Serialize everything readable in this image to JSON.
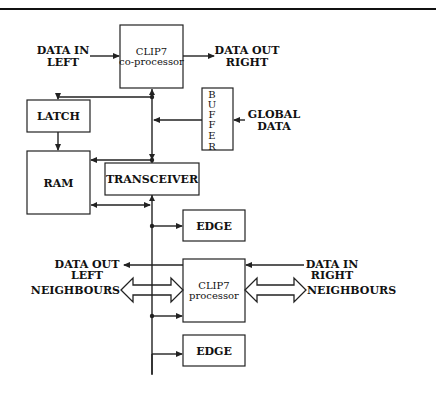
{
  "diagram": {
    "type": "block-diagram",
    "blocks": {
      "coprocessor": {
        "title": "CLIP7",
        "subtitle": "co-processor"
      },
      "latch": {
        "label": "LATCH"
      },
      "ram": {
        "label": "RAM"
      },
      "transceiver": {
        "label": "TRANSCEIVER"
      },
      "buffer": {
        "letters": [
          "B",
          "U",
          "F",
          "F",
          "E",
          "R"
        ]
      },
      "edge_top": {
        "label": "EDGE"
      },
      "processor": {
        "title": "CLIP7",
        "subtitle": "processor"
      },
      "edge_bottom": {
        "label": "EDGE"
      }
    },
    "signals": {
      "data_in_left": [
        "DATA IN",
        "LEFT"
      ],
      "data_out_right": [
        "DATA OUT",
        "RIGHT"
      ],
      "global_data": [
        "GLOBAL",
        "DATA"
      ],
      "data_out_left": [
        "DATA OUT",
        "LEFT"
      ],
      "data_in_right": [
        "DATA IN",
        "RIGHT"
      ],
      "neighbours_left": "NEIGHBOURS",
      "neighbours_right": "NEIGHBOURS"
    },
    "connections": [
      {
        "from": "DATA IN LEFT",
        "to": "CLIP7 co-processor"
      },
      {
        "from": "CLIP7 co-processor",
        "to": "DATA OUT RIGHT"
      },
      {
        "from": "GLOBAL DATA",
        "to": "BUFFER"
      },
      {
        "from": "BUFFER",
        "to": "bus"
      },
      {
        "from": "bus",
        "to": "LATCH"
      },
      {
        "from": "LATCH",
        "to": "RAM"
      },
      {
        "from": "bus",
        "to": "RAM"
      },
      {
        "from": "RAM",
        "to": "bus",
        "bidirectional": true
      },
      {
        "from": "bus",
        "to": "TRANSCEIVER",
        "bidirectional": true
      },
      {
        "from": "bus",
        "to": "EDGE (top)"
      },
      {
        "from": "CLIP7 processor",
        "to": "DATA OUT LEFT"
      },
      {
        "from": "DATA IN RIGHT",
        "to": "CLIP7 processor"
      },
      {
        "from": "NEIGHBOURS (left)",
        "to": "CLIP7 processor",
        "bidirectional": true
      },
      {
        "from": "CLIP7 processor",
        "to": "NEIGHBOURS (right)",
        "bidirectional": true
      },
      {
        "from": "bus",
        "to": "CLIP7 processor"
      },
      {
        "from": "bus",
        "to": "EDGE (bottom)"
      }
    ]
  }
}
